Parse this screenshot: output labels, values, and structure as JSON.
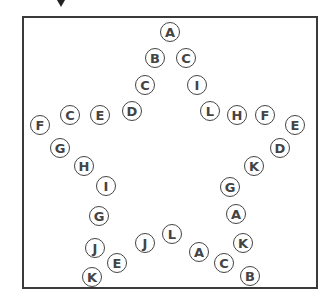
{
  "puzzle": {
    "shape": "star",
    "frame_color": "#3a3a3a",
    "circle_color": "#444444",
    "nodes": [
      {
        "letter": "A",
        "x": 170,
        "y": 32
      },
      {
        "letter": "B",
        "x": 155,
        "y": 58
      },
      {
        "letter": "C",
        "x": 186,
        "y": 58
      },
      {
        "letter": "C",
        "x": 145,
        "y": 85
      },
      {
        "letter": "I",
        "x": 197,
        "y": 85
      },
      {
        "letter": "D",
        "x": 132,
        "y": 111
      },
      {
        "letter": "L",
        "x": 210,
        "y": 111
      },
      {
        "letter": "H",
        "x": 237,
        "y": 115
      },
      {
        "letter": "F",
        "x": 265,
        "y": 115
      },
      {
        "letter": "E",
        "x": 295,
        "y": 125
      },
      {
        "letter": "F",
        "x": 40,
        "y": 125
      },
      {
        "letter": "C",
        "x": 70,
        "y": 115
      },
      {
        "letter": "E",
        "x": 100,
        "y": 115
      },
      {
        "letter": "G",
        "x": 60,
        "y": 148
      },
      {
        "letter": "H",
        "x": 84,
        "y": 166
      },
      {
        "letter": "I",
        "x": 106,
        "y": 186
      },
      {
        "letter": "D",
        "x": 280,
        "y": 148
      },
      {
        "letter": "K",
        "x": 254,
        "y": 166
      },
      {
        "letter": "G",
        "x": 230,
        "y": 187
      },
      {
        "letter": "G",
        "x": 99,
        "y": 216
      },
      {
        "letter": "A",
        "x": 236,
        "y": 214
      },
      {
        "letter": "J",
        "x": 95,
        "y": 248
      },
      {
        "letter": "E",
        "x": 117,
        "y": 263
      },
      {
        "letter": "K",
        "x": 92,
        "y": 277
      },
      {
        "letter": "J",
        "x": 145,
        "y": 243
      },
      {
        "letter": "L",
        "x": 172,
        "y": 234
      },
      {
        "letter": "A",
        "x": 199,
        "y": 252
      },
      {
        "letter": "K",
        "x": 243,
        "y": 243
      },
      {
        "letter": "C",
        "x": 224,
        "y": 263
      },
      {
        "letter": "B",
        "x": 250,
        "y": 276
      }
    ]
  }
}
